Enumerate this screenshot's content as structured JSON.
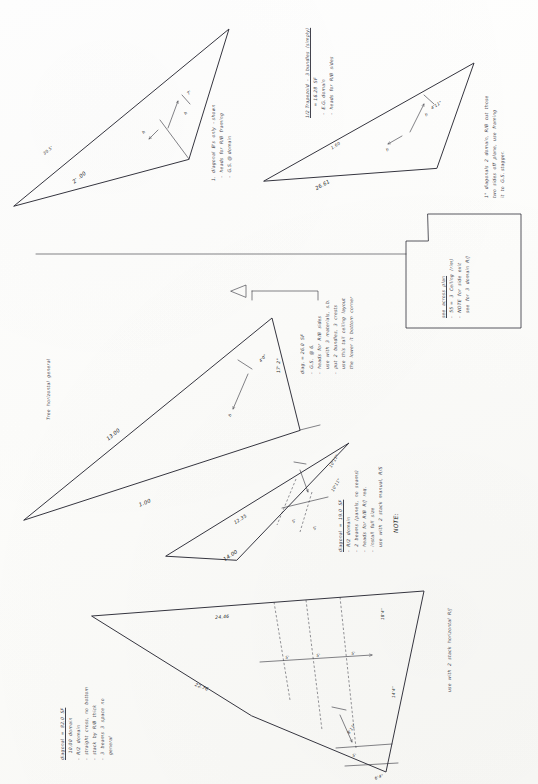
{
  "document": {
    "title": "Handwritten engineering sketch sheet",
    "orientation": "landscape-notes-on-portrait-page",
    "ink_color": "#2b2b33",
    "paper_color": "#fdfdfb"
  },
  "figures": [
    {
      "id": "fig-top-left-triangle",
      "name": "top-left-triangle",
      "labels": [
        {
          "id": "tl-dim-hyp",
          "text": "2' .00"
        },
        {
          "id": "tl-angle",
          "text": "30.5'"
        },
        {
          "id": "tl-h",
          "text": "h"
        },
        {
          "id": "tl-h2",
          "text": "h"
        },
        {
          "id": "tl-small",
          "text": "7'"
        }
      ],
      "annotation": [
        "1.  diagonal  B's  only  - shown",
        "  -  heads  for  R/B  framing",
        "  -  G.S. @ domain"
      ]
    },
    {
      "id": "fig-top-right-triangle",
      "name": "top-right-triangle",
      "labels": [
        {
          "id": "tr-dim-hyp",
          "text": "26.61"
        },
        {
          "id": "tr-h",
          "text": "h"
        },
        {
          "id": "tr-h2",
          "text": "h"
        },
        {
          "id": "tr-side",
          "text": "1.60"
        },
        {
          "id": "tr-small",
          "text": "4'11\""
        }
      ],
      "annotation_header": "1/2 Trapezoid  -  3 bundles  (simply)",
      "annotation": [
        "       = 16.28  SF",
        "  -  E.G. domain",
        "  -  heads  for  R/B  sides"
      ],
      "annotation_right": [
        "1\"  diagonals  2  domain,  R/B  cut  those",
        "two  sides  off  plane,  use  framing",
        "it  to  G.S. stagger."
      ]
    },
    {
      "id": "fig-rect-panel",
      "name": "right-rectangle-panel",
      "annotation": [
        "see  across  plan",
        "-  55 =  3  Ceiling  (rim)",
        "-  NOTE  for  side  exit",
        "   see  for  3  domain  R/J"
      ]
    },
    {
      "id": "fig-mid-triangle",
      "name": "middle-large-triangle",
      "labels": [
        {
          "id": "mid-left-dim",
          "text": "13.00"
        },
        {
          "id": "mid-base",
          "text": "1.00"
        },
        {
          "id": "mid-h",
          "text": "h"
        },
        {
          "id": "mid-angle",
          "text": "17' 2\""
        },
        {
          "id": "mid-small",
          "text": "4'0\""
        }
      ],
      "annotation": [
        "-  G.S.  @ 6.",
        "-  heads  for  R/B  sides",
        "   use  with  3  materials,  s.b.",
        "-  put  2  bundles,  3  crests",
        "   use  this  tail  ceiling  layout",
        "   the  lower  it  bottom  corner"
      ],
      "top_label": "diag. = 26.0  SF"
    },
    {
      "id": "fig-lower-mid-triangle",
      "name": "lower-middle-triangle",
      "labels": [
        {
          "id": "lm-base",
          "text": "14.00"
        },
        {
          "id": "lm-left",
          "text": "12.35"
        },
        {
          "id": "lm-right",
          "text": "10'11\""
        },
        {
          "id": "lm-top",
          "text": "10'11\""
        },
        {
          "id": "lm-tick1",
          "text": "5'"
        },
        {
          "id": "lm-tick2",
          "text": "5'"
        }
      ],
      "annotation_header": "diagonal  =  19.0  SF",
      "annotation": [
        "-  R/2  domain",
        "-  2  beams  (panels,  no  seams)",
        "-  heads  for  R/B  R/J  req.",
        "-  install  full  size",
        "   use  with  2  stack  manual,  R/S"
      ],
      "note_label": "NOTE:"
    },
    {
      "id": "fig-bottom-triangle",
      "name": "bottom-large-triangle",
      "labels": [
        {
          "id": "bt-top",
          "text": "24.46"
        },
        {
          "id": "bt-left",
          "text": "22.76"
        },
        {
          "id": "bt-right",
          "text": "18'4\""
        },
        {
          "id": "bt-r2",
          "text": "14'4\""
        },
        {
          "id": "bt-tick1",
          "text": "5'"
        },
        {
          "id": "bt-tick2",
          "text": "5'"
        },
        {
          "id": "bt-tick3",
          "text": "5'"
        },
        {
          "id": "bt-tick4",
          "text": "5'"
        },
        {
          "id": "bt-corner",
          "text": "8'11\""
        },
        {
          "id": "bt-bottom",
          "text": "6'4\""
        }
      ],
      "annotation_header": "diagonal  =  82.0  SF",
      "annotation": [
        "    10.00  domain",
        "-  R/2  domain",
        "-  straight  cross,  no  bottom",
        "-  stack  by  R/B  thick",
        "-  3  beams  3  space  no",
        "   general"
      ],
      "side_note": "use  with  2  stack  horizontal  R/J"
    }
  ],
  "callouts": {
    "horizontal_label": "Tree  horizontal  general",
    "note_marker": "NOTE:"
  }
}
